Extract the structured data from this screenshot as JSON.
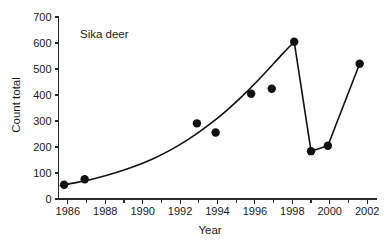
{
  "chart_data": {
    "type": "scatter",
    "title": "",
    "annotation": "Sika deer",
    "xlabel": "Year",
    "ylabel": "Count total",
    "xlim": [
      1985.5,
      2002.5
    ],
    "ylim": [
      0,
      700
    ],
    "grid": false,
    "legend": "none",
    "x_ticks": [
      1986,
      1987,
      1988,
      1989,
      1990,
      1991,
      1992,
      1993,
      1994,
      1995,
      1996,
      1997,
      1998,
      1999,
      2000,
      2001,
      2002
    ],
    "x_tick_labels": [
      "1986",
      "",
      "1988",
      "",
      "1990",
      "",
      "1992",
      "",
      "1994",
      "",
      "1996",
      "",
      "1998",
      "",
      "2000",
      "",
      "2002"
    ],
    "y_ticks": [
      0,
      100,
      200,
      300,
      400,
      500,
      600,
      700
    ],
    "y_tick_labels": [
      "0",
      "100",
      "200",
      "300",
      "400",
      "500",
      "600",
      "700"
    ],
    "series": [
      {
        "name": "Sika deer counts",
        "marker": "filled-circle",
        "x": [
          1985.8,
          1986.9,
          1992.9,
          1993.9,
          1995.8,
          1996.9,
          1998.1,
          1999.0,
          1999.9,
          2001.6
        ],
        "values": [
          55,
          76,
          291,
          256,
          405,
          424,
          605,
          184,
          205,
          520
        ]
      }
    ],
    "fit_curve": {
      "name": "exponential trend fit",
      "x": [
        1985.6,
        1986.5,
        1987.5,
        1988.5,
        1989.5,
        1990.5,
        1991.5,
        1992.5,
        1993.5,
        1994.5,
        1995.5,
        1996.5,
        1997.5,
        1998.1
      ],
      "values": [
        52,
        64,
        80,
        100,
        124,
        153,
        189,
        232,
        283,
        341,
        408,
        482,
        560,
        605
      ]
    },
    "connector_line": {
      "name": "post-peak connecting segments",
      "x": [
        1998.1,
        1999.0,
        1999.9,
        2001.6
      ],
      "values": [
        605,
        184,
        205,
        520
      ]
    }
  },
  "colors": {
    "marker": "#111111",
    "line": "#111111",
    "axis": "#2b2b2b",
    "text": "#1a1a1a",
    "background": "#ffffff"
  }
}
